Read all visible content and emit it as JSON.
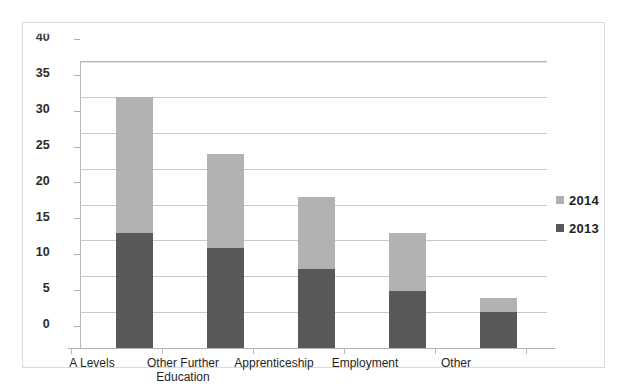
{
  "chart_data": {
    "type": "bar",
    "subtype": "stacked-vertical-bar",
    "title": "",
    "subtitle": "",
    "xlabel": "",
    "ylabel": "",
    "categories": [
      "A Levels",
      "Other Further Education",
      "Apprenticeship",
      "Employment",
      "Other"
    ],
    "series": [
      {
        "name": "2013",
        "color": "#595959",
        "values": [
          16,
          14,
          11,
          8,
          5
        ]
      },
      {
        "name": "2014",
        "color": "#b2b2b2",
        "values": [
          19,
          13,
          10,
          8,
          2
        ]
      }
    ],
    "totals": [
      35,
      27,
      21,
      16,
      7
    ],
    "ylim": [
      0,
      40
    ],
    "ytick_values": [
      0,
      5,
      10,
      15,
      20,
      25,
      30,
      35,
      40
    ],
    "ytick_labels": [
      "0",
      "5",
      "10",
      "15",
      "20",
      "25",
      "30",
      "35",
      "40"
    ],
    "grid": true,
    "grid_axis": "y",
    "legend_position": "right",
    "legend_entries": [
      "2014",
      "2013"
    ],
    "stack_order_bottom_to_top": [
      "2013",
      "2014"
    ]
  },
  "axis": {
    "y_ticks": [
      {
        "label": "40",
        "value": 40
      },
      {
        "label": "35",
        "value": 35
      },
      {
        "label": "30",
        "value": 30
      },
      {
        "label": "25",
        "value": 25
      },
      {
        "label": "20",
        "value": 20
      },
      {
        "label": "15",
        "value": 15
      },
      {
        "label": "10",
        "value": 10
      },
      {
        "label": "5",
        "value": 5
      },
      {
        "label": "0",
        "value": 0
      }
    ],
    "x_categories": [
      {
        "label": "A Levels",
        "lines": [
          "A Levels"
        ]
      },
      {
        "label": "Other Further Education",
        "lines": [
          "Other Further",
          "Education"
        ]
      },
      {
        "label": "Apprenticeship",
        "lines": [
          "Apprenticeship"
        ]
      },
      {
        "label": "Employment",
        "lines": [
          "Employment"
        ]
      },
      {
        "label": "Other",
        "lines": [
          "Other"
        ]
      }
    ]
  },
  "legend": {
    "items": [
      {
        "label": "2014",
        "color": "#b2b2b2"
      },
      {
        "label": "2013",
        "color": "#595959"
      }
    ]
  },
  "colors": {
    "series_2013": "#595959",
    "series_2014": "#b2b2b2",
    "gridline": "#c9c9c9",
    "axis": "#b0b0b0",
    "frame": "#d9d9d9",
    "text": "#1f1f1f",
    "background": "#ffffff"
  }
}
